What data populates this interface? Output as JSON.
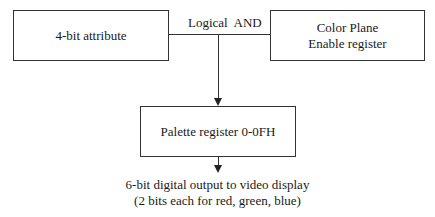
{
  "diagram": {
    "nodes": {
      "attribute": {
        "label": "4-bit attribute"
      },
      "color_plane": {
        "line1": "Color Plane",
        "line2": "Enable register"
      },
      "palette": {
        "label": "Palette register 0-0FH"
      }
    },
    "operation": {
      "label": "Logical  AND"
    },
    "output": {
      "line1": "6-bit digital output to video display",
      "line2": "(2 bits each for red, green, blue)"
    },
    "edges": [
      {
        "from": "attribute",
        "to": "palette",
        "via": "Logical AND"
      },
      {
        "from": "color_plane",
        "to": "palette",
        "via": "Logical AND"
      },
      {
        "from": "palette",
        "to": "output"
      }
    ]
  }
}
